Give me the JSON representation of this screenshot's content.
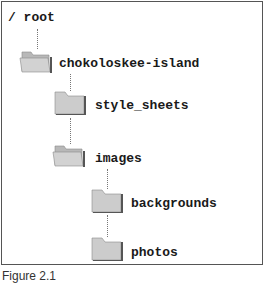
{
  "diagram": {
    "type": "directory-tree",
    "root": {
      "label": "/ root"
    },
    "nodes": [
      {
        "label": "chokoloskee-island",
        "depth": 1,
        "folder_state": "open"
      },
      {
        "label": "style_sheets",
        "depth": 2,
        "folder_state": "closed"
      },
      {
        "label": "images",
        "depth": 2,
        "folder_state": "open"
      },
      {
        "label": "backgrounds",
        "depth": 3,
        "folder_state": "closed"
      },
      {
        "label": "photos",
        "depth": 3,
        "folder_state": "closed"
      }
    ],
    "colors": {
      "folder_fill": "#c8c8c8",
      "folder_shadow": "#555555",
      "connector": "#777777",
      "border": "#555555",
      "text": "#1a1a1a"
    }
  },
  "caption": "Figure 2.1"
}
